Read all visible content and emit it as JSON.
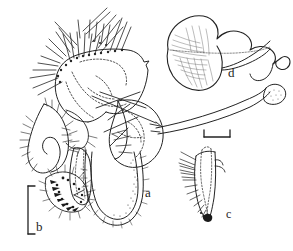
{
  "figure": {
    "kind": "scientific-line-drawing",
    "background_color": "#ffffff",
    "ink_color": "#1f1f1f",
    "width_px": 293,
    "height_px": 251,
    "panels": [
      {
        "id": "a",
        "label": "a",
        "description": "whole hypopygium in lateral-ventral aspect: setose gonocoxites with long bristles dorsally, dotted internal outlines, curved hooked parameres at left, U-shaped pubescent lobe ventrally, and a long slender aedeagal rod extending to the right",
        "label_x": 145,
        "label_y": 186
      },
      {
        "id": "b",
        "label": "b",
        "description": "detail of the apex of the curved hooked process bearing dense dark spine-like setae; vertical bracket scale bar at its left",
        "label_x": 36,
        "label_y": 220
      },
      {
        "id": "c",
        "label": "c",
        "description": "detail of the gonostylus: tapering sclerite with a comb of long bristles along the left margin and a dark pigmented tip",
        "label_x": 226,
        "label_y": 208
      },
      {
        "id": "d",
        "label": "d",
        "description": "detail of the fan-shaped ejaculatory apodeme with fine radiating striae and an apical recurved hook",
        "label_x": 228,
        "label_y": 66
      }
    ],
    "scale_bars": [
      {
        "name": "scale-bar-top-right",
        "orientation": "horizontal",
        "x": 204,
        "y": 134,
        "length_px": 26,
        "caption": ""
      },
      {
        "name": "scale-bar-left",
        "orientation": "vertical",
        "x": 31,
        "y": 186,
        "length_px": 48,
        "caption": ""
      }
    ]
  }
}
